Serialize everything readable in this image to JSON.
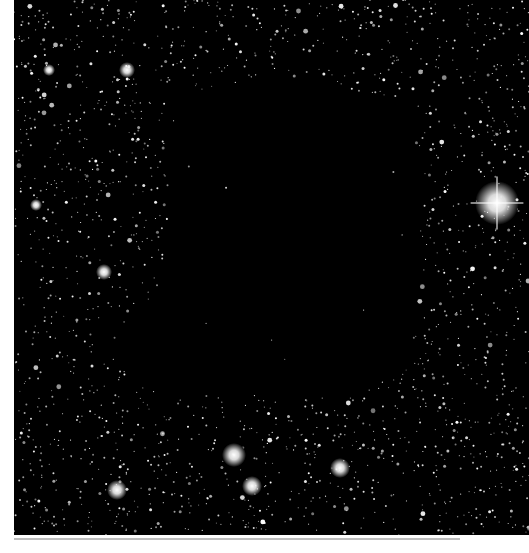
{
  "image": {
    "subject": "dark molecular cloud silhouetted against dense star field",
    "background_color": "#000000",
    "star_color": "#ffffff",
    "page_color": "#ffffff",
    "frame": {
      "x": 14,
      "y": 0,
      "width": 515,
      "height": 535
    }
  },
  "dark_cloud": {
    "polygon": [
      [
        180,
        95
      ],
      [
        260,
        75
      ],
      [
        340,
        85
      ],
      [
        400,
        110
      ],
      [
        420,
        170
      ],
      [
        418,
        250
      ],
      [
        410,
        320
      ],
      [
        400,
        370
      ],
      [
        360,
        395
      ],
      [
        280,
        400
      ],
      [
        200,
        395
      ],
      [
        130,
        385
      ],
      [
        115,
        345
      ],
      [
        130,
        310
      ],
      [
        165,
        290
      ],
      [
        168,
        240
      ],
      [
        170,
        180
      ],
      [
        172,
        130
      ]
    ]
  },
  "bright_stars": [
    {
      "x": 497,
      "y": 203,
      "r": 11,
      "spikes": true
    },
    {
      "x": 234,
      "y": 455,
      "r": 6
    },
    {
      "x": 117,
      "y": 490,
      "r": 5
    },
    {
      "x": 252,
      "y": 486,
      "r": 5
    },
    {
      "x": 340,
      "y": 468,
      "r": 5
    },
    {
      "x": 127,
      "y": 70,
      "r": 4
    },
    {
      "x": 104,
      "y": 272,
      "r": 4
    },
    {
      "x": 49,
      "y": 70,
      "r": 3
    },
    {
      "x": 36,
      "y": 205,
      "r": 3
    }
  ],
  "star_field": {
    "count": 2600,
    "seed": 68
  }
}
